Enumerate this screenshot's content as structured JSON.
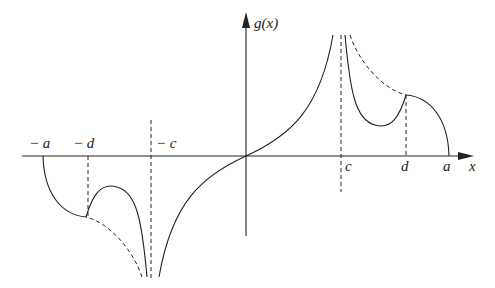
{
  "diagram": {
    "axes": {
      "y_label": "g(x)",
      "x_label": "x"
    },
    "x_ticks": {
      "neg_a": "− a",
      "neg_d": "− d",
      "neg_c": "− c",
      "c": "c",
      "d": "d",
      "a": "a"
    },
    "colors": {
      "stroke": "#222222",
      "background": "#ffffff"
    },
    "elements": [
      {
        "type": "solid-curve",
        "desc": "from origin rising to asymptote at x=c"
      },
      {
        "type": "solid-curve",
        "desc": "from asymptote at c descending to a local min then rising to cusp at d"
      },
      {
        "type": "solid-curve",
        "desc": "from d arc descending to zero at a"
      },
      {
        "type": "dashed-curve",
        "desc": "continuation from asymptote c to d above"
      },
      {
        "type": "dashed-vertical",
        "desc": "asymptote x=c"
      },
      {
        "type": "dashed-vertical",
        "desc": "x=d"
      },
      {
        "type": "mirror",
        "desc": "odd symmetry on negative side"
      }
    ]
  }
}
